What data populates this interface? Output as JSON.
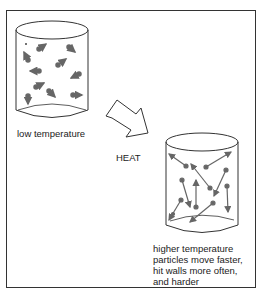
{
  "diagram": {
    "title": "",
    "left_container": {
      "caption": "low temperature",
      "particle_count": 10
    },
    "arrow": {
      "label": "HEAT"
    },
    "right_container": {
      "caption_lines": [
        "higher temperature",
        "particles move faster,",
        "hit walls more often,",
        "and harder"
      ],
      "particle_count": 10
    },
    "colors": {
      "line": "#333333",
      "particle": "#666666",
      "background": "#ffffff"
    }
  }
}
